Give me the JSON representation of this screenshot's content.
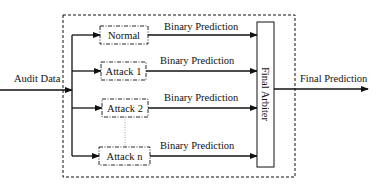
{
  "diagram": {
    "input_label": "Audit Data",
    "output_label": "Final Prediction",
    "arbiter_label": "Final Arbiter",
    "classifiers": [
      {
        "label": "Normal",
        "edge_label": "Binary Prediction"
      },
      {
        "label": "Attack 1",
        "edge_label": "Binary Prediction"
      },
      {
        "label": "Attack 2",
        "edge_label": "Binary Prediction"
      },
      {
        "label": "Attack n",
        "edge_label": "Binary Prediction"
      }
    ],
    "colors": {
      "stroke": "#111111",
      "background": "#ffffff",
      "ellipsis_dots": "#888888"
    }
  }
}
